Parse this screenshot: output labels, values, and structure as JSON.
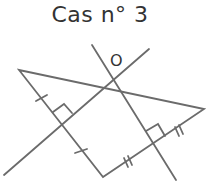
{
  "title": "Cas n° 3",
  "point_label": "O",
  "colors": {
    "stroke": "#6b6b6b",
    "text": "#333333"
  },
  "diagram": {
    "triangle": {
      "A": [
        19,
        70
      ],
      "B": [
        204,
        109
      ],
      "C": [
        103,
        177
      ]
    },
    "perpendicular_bisector_AC": {
      "from": [
        4,
        175
      ],
      "to": [
        149,
        49
      ]
    },
    "perpendicular_bisector_BC": {
      "from": [
        92,
        45
      ],
      "to": [
        176,
        180
      ]
    },
    "circumcenter_O": [
      113,
      79
    ],
    "marks": {
      "AC": "single-tick",
      "BC": "double-tick",
      "right_angles": 2
    }
  }
}
